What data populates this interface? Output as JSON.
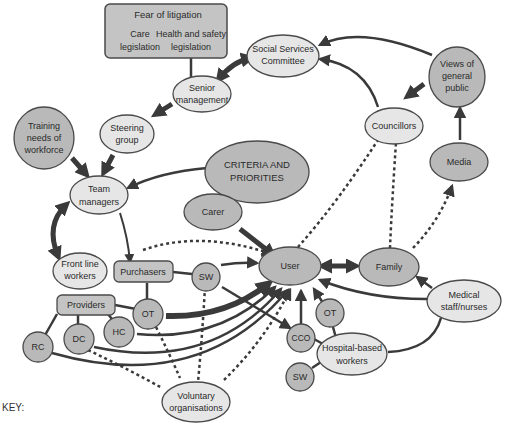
{
  "diagram": {
    "colors": {
      "light_node": "#e6e6e6",
      "dark_node": "#b9b9b9",
      "box_fill": "#c4c4c4",
      "stroke": "#4a4a4a",
      "edge": "#3a3a3a"
    },
    "legislation_box": {
      "title": "Fear of litigation",
      "left_line1": "Care",
      "left_line2": "legislation",
      "right_line1": "Health and safety",
      "right_line2": "legislation"
    },
    "nodes": {
      "social_services_1": "Social Services",
      "social_services_2": "Committee",
      "senior_1": "Senior",
      "senior_2": "management",
      "steering_1": "Steering",
      "steering_2": "group",
      "training_1": "Training",
      "training_2": "needs of",
      "training_3": "workforce",
      "views_1": "Views of",
      "views_2": "general",
      "views_3": "public",
      "councillors": "Councillors",
      "media": "Media",
      "criteria_1": "CRITERIA AND",
      "criteria_2": "PRIORITIES",
      "team_1": "Team",
      "team_2": "managers",
      "carer": "Carer",
      "frontline_1": "Front line",
      "frontline_2": "workers",
      "purchasers": "Purchasers",
      "sw_top": "SW",
      "user": "User",
      "family": "Family",
      "providers": "Providers",
      "ot_left": "OT",
      "hc": "HC",
      "dc": "DC",
      "rc": "RC",
      "ot_right": "OT",
      "cco": "CCO",
      "sw_bottom": "SW",
      "hospital_1": "Hospital-based",
      "hospital_2": "workers",
      "medical_1": "Medical",
      "medical_2": "staff/nurses",
      "voluntary_1": "Voluntary",
      "voluntary_2": "organisations"
    },
    "key_label": "KEY:"
  }
}
